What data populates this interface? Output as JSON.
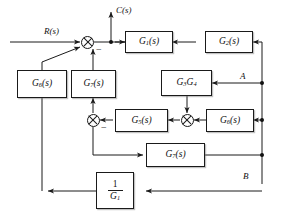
{
  "diagram": {
    "type": "control-system-block-diagram",
    "canvas": {
      "width": 282,
      "height": 215
    },
    "colors": {
      "line": "#1a1a1a",
      "text": "#111111",
      "background": "#ffffff"
    },
    "signals": {
      "input_label": "R(s)",
      "output_label": "C(s)"
    },
    "nodes": {
      "point_a_label": "A",
      "point_b_label": "B"
    },
    "blocks": [
      {
        "id": "g1",
        "label_main": "G",
        "label_sub": "1",
        "label_tail": "(s)",
        "text": "G1(s)"
      },
      {
        "id": "g2",
        "label_main": "G",
        "label_sub": "2",
        "label_tail": "(s)",
        "text": "G2(s)"
      },
      {
        "id": "g6",
        "label_main": "G",
        "label_sub": "6",
        "label_tail": "(s)",
        "text": "G6(s)"
      },
      {
        "id": "g7",
        "label_main": "G",
        "label_sub": "7",
        "label_tail": "(s)",
        "text": "G7(s)"
      },
      {
        "id": "g3g4",
        "label_main": "G",
        "label_sub": "3",
        "label_tail": "G",
        "label_sub2": "4",
        "text": "G3G4"
      },
      {
        "id": "g5",
        "label_main": "G",
        "label_sub": "5",
        "label_tail": "(s)",
        "text": "G5(s)"
      },
      {
        "id": "g8",
        "label_main": "G",
        "label_sub": "8",
        "label_tail": "(s)",
        "text": "G8(s)"
      },
      {
        "id": "g9",
        "label_main": "G",
        "label_sub": "9",
        "label_tail": "(s)",
        "text": "G9(s)"
      },
      {
        "id": "inv_g1",
        "numerator": "1",
        "denominator_main": "G",
        "denominator_sub": "1",
        "text": "1/G1"
      }
    ],
    "summing_junctions": [
      {
        "id": "sum-top",
        "signs": [
          "+",
          "-"
        ],
        "minus_label": "−"
      },
      {
        "id": "sum-mid-left",
        "signs": [
          "+",
          "-"
        ],
        "minus_label": "−"
      },
      {
        "id": "sum-mid-right",
        "signs": [
          "+",
          "+"
        ],
        "minus_label": ""
      }
    ]
  }
}
